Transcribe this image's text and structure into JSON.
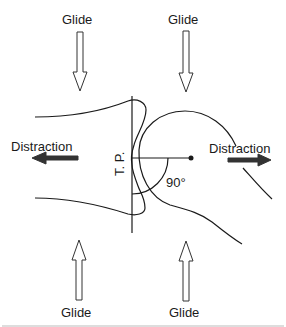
{
  "diagram": {
    "labels": {
      "glide_top_left": "Glide",
      "glide_top_right": "Glide",
      "glide_bottom_left": "Glide",
      "glide_bottom_right": "Glide",
      "distraction_left": "Distraction",
      "distraction_right": "Distraction",
      "treatment_plane": "T. P.",
      "angle": "90°"
    },
    "arrows": [
      {
        "id": "glide-top-left",
        "style": "hollow",
        "direction": "down"
      },
      {
        "id": "glide-top-right",
        "style": "hollow",
        "direction": "down"
      },
      {
        "id": "glide-bottom-left",
        "style": "hollow",
        "direction": "up"
      },
      {
        "id": "glide-bottom-right",
        "style": "hollow",
        "direction": "up"
      },
      {
        "id": "distraction-left",
        "style": "solid",
        "direction": "left"
      },
      {
        "id": "distraction-right",
        "style": "solid",
        "direction": "right"
      }
    ],
    "colors": {
      "line": "#1a1a1a",
      "background": "#ffffff",
      "solid_arrow": "#333333"
    }
  }
}
